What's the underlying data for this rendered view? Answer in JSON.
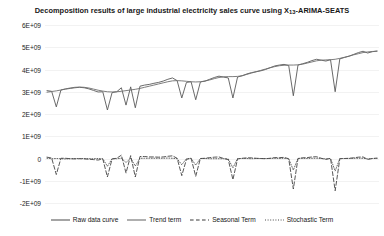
{
  "chart_data": {
    "type": "line",
    "title": "Decomposition results of large industrial electricity sales curve using X13-ARIMA-SEATS",
    "title_main": "Decomposition results of large industrial electricity sales curve using X",
    "title_sub": "13",
    "title_tail": "-ARIMA-SEATS",
    "xlabel": "",
    "ylabel": "",
    "grid": true,
    "legend_position": "bottom-center",
    "ylim": [
      -2000000000,
      6000000000
    ],
    "ytick_labels": [
      "6E+09",
      "5E+09",
      "4E+09",
      "3E+09",
      "2E+09",
      "1E+09",
      "0",
      "-1E+09",
      "-2E+09"
    ],
    "ytick_values": [
      6000000000,
      5000000000,
      4000000000,
      3000000000,
      2000000000,
      1000000000,
      0,
      -1000000000,
      -2000000000
    ],
    "xlim": [
      0,
      71
    ],
    "x": [
      0,
      1,
      2,
      3,
      4,
      5,
      6,
      7,
      8,
      9,
      10,
      11,
      12,
      13,
      14,
      15,
      16,
      17,
      18,
      19,
      20,
      21,
      22,
      23,
      24,
      25,
      26,
      27,
      28,
      29,
      30,
      31,
      32,
      33,
      34,
      35,
      36,
      37,
      38,
      39,
      40,
      41,
      42,
      43,
      44,
      45,
      46,
      47,
      48,
      49,
      50,
      51,
      52,
      53,
      54,
      55,
      56,
      57,
      58,
      59,
      60,
      61,
      62,
      63,
      64,
      65,
      66,
      67,
      68,
      69,
      70,
      71
    ],
    "series": [
      {
        "name": "Raw data curve",
        "style": "solid",
        "color": "#595959",
        "values": [
          3050000000,
          3020000000,
          2320000000,
          3080000000,
          3120000000,
          3150000000,
          3180000000,
          3200000000,
          3180000000,
          3130000000,
          3060000000,
          2990000000,
          3000000000,
          2180000000,
          2960000000,
          3000000000,
          3180000000,
          2400000000,
          3220000000,
          2280000000,
          3250000000,
          3300000000,
          3330000000,
          3380000000,
          3420000000,
          3480000000,
          3560000000,
          3620000000,
          3500000000,
          2720000000,
          3420000000,
          3450000000,
          2640000000,
          3440000000,
          3480000000,
          3560000000,
          3640000000,
          3700000000,
          3660000000,
          3620000000,
          2720000000,
          3660000000,
          3720000000,
          3800000000,
          3860000000,
          3900000000,
          3940000000,
          4000000000,
          4080000000,
          4160000000,
          4200000000,
          4230000000,
          4180000000,
          2820000000,
          4200000000,
          4260000000,
          4320000000,
          4400000000,
          4460000000,
          4420000000,
          4380000000,
          4440000000,
          3000000000,
          4480000000,
          4540000000,
          4600000000,
          4680000000,
          4760000000,
          4820000000,
          4740000000,
          4800000000,
          4830000000
        ]
      },
      {
        "name": "Trend term",
        "style": "solid",
        "color": "#6e6e6e",
        "values": [
          2980000000,
          3010000000,
          3040000000,
          3080000000,
          3130000000,
          3170000000,
          3200000000,
          3210000000,
          3200000000,
          3170000000,
          3120000000,
          3070000000,
          3030000000,
          3000000000,
          2990000000,
          3000000000,
          3020000000,
          3050000000,
          3080000000,
          3110000000,
          3150000000,
          3200000000,
          3250000000,
          3300000000,
          3350000000,
          3400000000,
          3450000000,
          3490000000,
          3500000000,
          3490000000,
          3470000000,
          3450000000,
          3440000000,
          3450000000,
          3480000000,
          3530000000,
          3590000000,
          3640000000,
          3670000000,
          3680000000,
          3680000000,
          3690000000,
          3720000000,
          3780000000,
          3840000000,
          3900000000,
          3960000000,
          4020000000,
          4080000000,
          4130000000,
          4170000000,
          4190000000,
          4200000000,
          4200000000,
          4210000000,
          4240000000,
          4290000000,
          4340000000,
          4390000000,
          4420000000,
          4430000000,
          4440000000,
          4460000000,
          4500000000,
          4550000000,
          4600000000,
          4660000000,
          4710000000,
          4760000000,
          4790000000,
          4810000000,
          4820000000
        ]
      },
      {
        "name": "Seasonal Term",
        "style": "dashed",
        "color": "#3a3a3a",
        "values": [
          60000000,
          20000000,
          -720000000,
          10000000,
          10000000,
          -10000000,
          -20000000,
          -10000000,
          -20000000,
          -30000000,
          -50000000,
          -70000000,
          -20000000,
          -830000000,
          -20000000,
          10000000,
          150000000,
          -650000000,
          130000000,
          -830000000,
          90000000,
          90000000,
          70000000,
          70000000,
          60000000,
          70000000,
          100000000,
          120000000,
          10000000,
          -770000000,
          -40000000,
          10000000,
          -800000000,
          0,
          10000000,
          40000000,
          60000000,
          70000000,
          0,
          -50000000,
          -950000000,
          -20000000,
          10000000,
          30000000,
          30000000,
          10000000,
          0,
          -10000000,
          10000000,
          40000000,
          40000000,
          50000000,
          -10000000,
          -1370000000,
          0,
          30000000,
          40000000,
          70000000,
          80000000,
          10000000,
          -40000000,
          10000000,
          -1450000000,
          -10000000,
          0,
          10000000,
          30000000,
          60000000,
          70000000,
          -40000000,
          0,
          20000000
        ]
      },
      {
        "name": "Stochastic Term",
        "style": "dotted",
        "color": "#4a4a4a",
        "values": [
          10000000,
          -10000000,
          0,
          -10000000,
          -20000000,
          -10000000,
          0,
          0,
          0,
          -10000000,
          -10000000,
          0,
          -10000000,
          -350000000,
          -10000000,
          -10000000,
          10000000,
          -180000000,
          10000000,
          -340000000,
          10000000,
          10000000,
          10000000,
          10000000,
          10000000,
          10000000,
          20000000,
          10000000,
          -10000000,
          -280000000,
          -10000000,
          10000000,
          -300000000,
          0,
          0,
          -10000000,
          -10000000,
          -10000000,
          -10000000,
          -20000000,
          -420000000,
          0,
          0,
          0,
          -10000000,
          0,
          0,
          0,
          0,
          10000000,
          0,
          10000000,
          -10000000,
          -520000000,
          0,
          10000000,
          0,
          10000000,
          10000000,
          0,
          -20000000,
          0,
          -560000000,
          0,
          0,
          0,
          10000000,
          10000000,
          10000000,
          -20000000,
          0,
          0
        ]
      }
    ]
  }
}
